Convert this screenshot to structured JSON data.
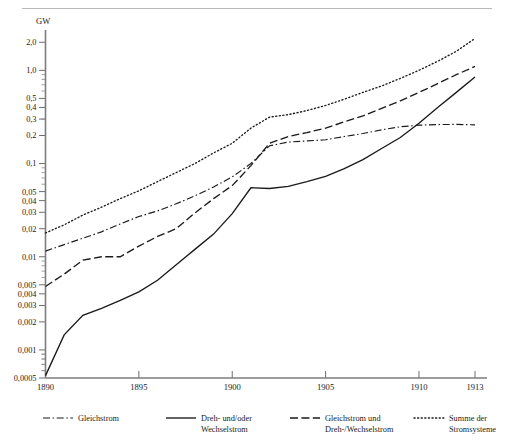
{
  "figure": {
    "unit_label": "GW",
    "y_axis": {
      "scale": "log",
      "tick_labels": [
        "2,0",
        "1,0",
        "0,5",
        "0,4",
        "0,3",
        "0,2",
        "0,1",
        "0,05",
        "0,04",
        "0,03",
        "0,02",
        "0,01",
        "0,005",
        "0,004",
        "0,003",
        "0,002",
        "0,001",
        "0,0005"
      ],
      "tick_values": [
        2.0,
        1.0,
        0.5,
        0.4,
        0.3,
        0.2,
        0.1,
        0.05,
        0.04,
        0.03,
        0.02,
        0.01,
        0.005,
        0.004,
        0.003,
        0.002,
        0.001,
        0.0005
      ],
      "range": [
        0.0005,
        2.4
      ]
    },
    "x_axis": {
      "tick_labels": [
        "1890",
        "1895",
        "1900",
        "1905",
        "1910",
        "1913"
      ],
      "tick_values": [
        1890,
        1895,
        1900,
        1905,
        1910,
        1913
      ],
      "range": [
        1890,
        1913
      ]
    },
    "legend": [
      {
        "key": "gleichstrom",
        "label_line1": "Gleichstrom",
        "label_line2": "",
        "style": "dash-dot"
      },
      {
        "key": "dreh_wechsel",
        "label_line1": "Dreh- und/oder",
        "label_line2": "Wechselstrom",
        "style": "solid"
      },
      {
        "key": "gleich_und_dreh",
        "label_line1": "Gleichstrom und",
        "label_line2": "Dreh-/Wechselstrom",
        "style": "dashed"
      },
      {
        "key": "summe",
        "label_line1": "Summe der",
        "label_line2": "Stromsysteme",
        "style": "dotted"
      }
    ]
  },
  "chart_data": {
    "type": "line",
    "title": "",
    "xlabel": "",
    "ylabel": "GW",
    "yscale": "log",
    "ylim": [
      0.0005,
      2.4
    ],
    "xlim": [
      1890,
      1913
    ],
    "grid": false,
    "legend_position": "bottom",
    "x": [
      1890,
      1891,
      1892,
      1893,
      1894,
      1895,
      1896,
      1897,
      1898,
      1899,
      1900,
      1901,
      1902,
      1903,
      1904,
      1905,
      1906,
      1907,
      1908,
      1909,
      1910,
      1911,
      1912,
      1913
    ],
    "series": [
      {
        "name": "Gleichstrom",
        "style": "dash-dot",
        "values": [
          0.0115,
          0.0135,
          0.0158,
          0.0185,
          0.0225,
          0.027,
          0.031,
          0.037,
          0.045,
          0.056,
          0.072,
          0.1,
          0.155,
          0.17,
          0.175,
          0.18,
          0.195,
          0.21,
          0.23,
          0.248,
          0.258,
          0.262,
          0.263,
          0.26
        ]
      },
      {
        "name": "Dreh- und/oder Wechselstrom",
        "style": "solid",
        "values": [
          0.00053,
          0.00145,
          0.00235,
          0.0028,
          0.0034,
          0.0042,
          0.0056,
          0.0082,
          0.012,
          0.0175,
          0.029,
          0.055,
          0.054,
          0.057,
          0.064,
          0.073,
          0.088,
          0.11,
          0.145,
          0.19,
          0.27,
          0.4,
          0.58,
          0.85
        ]
      },
      {
        "name": "Gleichstrom und Dreh-/Wechselstrom",
        "style": "dashed",
        "values": [
          0.0048,
          0.0065,
          0.0092,
          0.01,
          0.01,
          0.013,
          0.0165,
          0.02,
          0.0295,
          0.042,
          0.058,
          0.095,
          0.165,
          0.195,
          0.215,
          0.24,
          0.28,
          0.325,
          0.39,
          0.47,
          0.58,
          0.72,
          0.9,
          1.1
        ]
      },
      {
        "name": "Summe der Stromsysteme",
        "style": "dotted",
        "values": [
          0.018,
          0.022,
          0.028,
          0.034,
          0.042,
          0.051,
          0.064,
          0.08,
          0.1,
          0.13,
          0.165,
          0.24,
          0.315,
          0.335,
          0.37,
          0.42,
          0.49,
          0.58,
          0.68,
          0.82,
          1.0,
          1.25,
          1.6,
          2.2
        ]
      }
    ]
  }
}
